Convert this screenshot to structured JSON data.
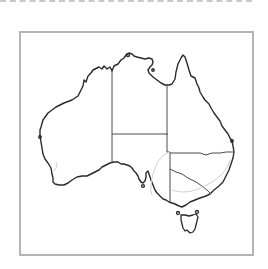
{
  "map": {
    "region": "Australia",
    "type": "outline map with state borders",
    "states": [
      "Western Australia",
      "Northern Territory",
      "Queensland",
      "South Australia",
      "New South Wales",
      "Victoria",
      "Tasmania"
    ],
    "colors": {
      "coastline": "#2a2a2a",
      "state_border": "#4a4a4a",
      "frame": "#b4b4b4",
      "top_rule": "#c8c8c8",
      "background": "#ffffff"
    }
  }
}
